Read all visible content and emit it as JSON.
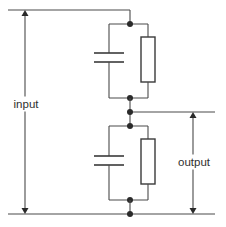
{
  "diagram": {
    "type": "capacitive-resistive voltage divider",
    "labels": {
      "input": "input",
      "output": "output"
    },
    "components": [
      {
        "id": "C1",
        "kind": "capacitor",
        "stage": "upper"
      },
      {
        "id": "R1",
        "kind": "resistor",
        "stage": "upper"
      },
      {
        "id": "C2",
        "kind": "capacitor",
        "stage": "lower"
      },
      {
        "id": "R2",
        "kind": "resistor",
        "stage": "lower"
      }
    ],
    "colors": {
      "line": "#4a4a4a",
      "node": "#2a2a2a",
      "text": "#2f2f2f",
      "background": "#ffffff"
    }
  }
}
